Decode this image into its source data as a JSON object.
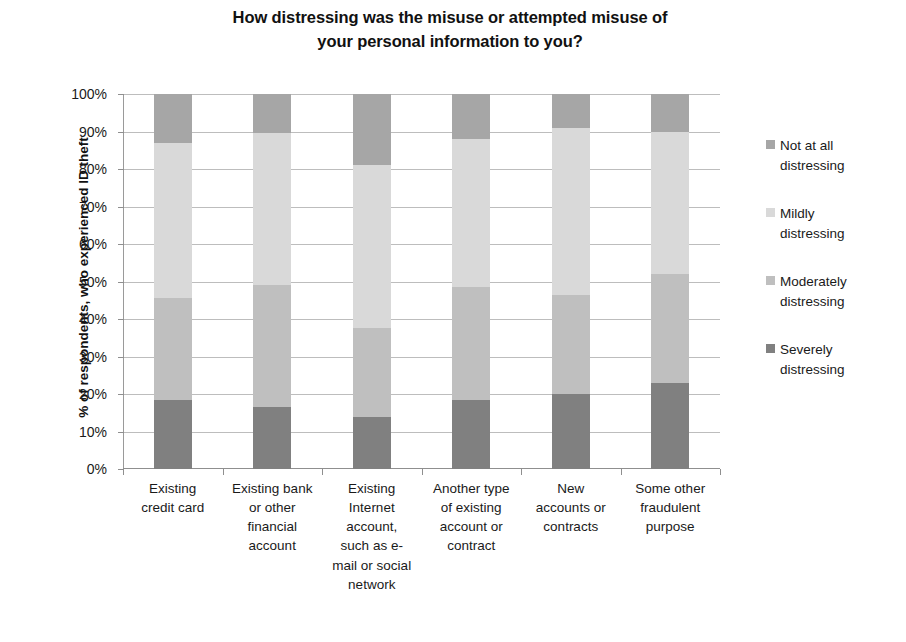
{
  "chart_data": {
    "type": "bar",
    "subtype": "stacked-percent-column",
    "title_lines": [
      "How distressing was the misuse or attempted misuse of",
      "your personal information to you?"
    ],
    "xlabel": "",
    "ylabel": "% of respondents, who experienced ID theft",
    "ylim": [
      0,
      100
    ],
    "ytick_labels": [
      "0%",
      "10%",
      "20%",
      "30%",
      "40%",
      "50%",
      "60%",
      "70%",
      "80%",
      "90%",
      "100%"
    ],
    "ytick_values": [
      0,
      10,
      20,
      30,
      40,
      50,
      60,
      70,
      80,
      90,
      100
    ],
    "grid": true,
    "legend_position": "right",
    "categories": [
      "Existing credit card",
      "Existing bank or other financial account",
      "Existing Internet account, such as e-mail or social network",
      "Another type of existing account or contract",
      "New accounts or contracts",
      "Some other fraudulent purpose"
    ],
    "category_label_lines": [
      [
        "Existing",
        "credit card"
      ],
      [
        "Existing bank",
        "or other",
        "financial",
        "account"
      ],
      [
        "Existing",
        "Internet",
        "account,",
        "such as e-",
        "mail or social",
        "network"
      ],
      [
        "Another type",
        "of existing",
        "account or",
        "contract"
      ],
      [
        "New",
        "accounts or",
        "contracts"
      ],
      [
        "Some other",
        "fraudulent",
        "purpose"
      ]
    ],
    "series": [
      {
        "name": "Severely distressing",
        "color": "#808080",
        "values": [
          18.5,
          16.5,
          14,
          18.5,
          20,
          23
        ]
      },
      {
        "name": "Moderately distressing",
        "color": "#bfbfbf",
        "values": [
          27,
          32.5,
          23.5,
          30,
          26.5,
          29
        ]
      },
      {
        "name": "Mildly distressing",
        "color": "#d9d9d9",
        "values": [
          41.5,
          40.5,
          43.5,
          39.5,
          44.5,
          38
        ]
      },
      {
        "name": "Not at all distressing",
        "color": "#a6a6a6",
        "values": [
          13,
          10.5,
          19,
          12,
          9,
          10
        ]
      }
    ],
    "cumulative_tops": {
      "severely": [
        18.5,
        16.5,
        14.0,
        18.5,
        20.0,
        23.0
      ],
      "moderately": [
        45.5,
        49.0,
        37.5,
        48.5,
        46.5,
        52.0
      ],
      "mildly": [
        87.0,
        89.5,
        81.0,
        88.0,
        91.0,
        90.0
      ],
      "not_at_all": [
        100,
        100,
        100,
        100,
        100,
        100
      ]
    }
  },
  "legend": {
    "items": [
      {
        "label_lines": [
          "Not at all",
          "distressing"
        ],
        "color": "#a6a6a6"
      },
      {
        "label_lines": [
          "Mildly",
          "distressing"
        ],
        "color": "#d9d9d9"
      },
      {
        "label_lines": [
          "Moderately",
          "distressing"
        ],
        "color": "#bfbfbf"
      },
      {
        "label_lines": [
          "Severely",
          "distressing"
        ],
        "color": "#808080"
      }
    ]
  },
  "colors": {
    "background": "#ffffff",
    "text": "#1a1a1a",
    "gridline": "#bdbdbd",
    "axis": "#8f8f8f",
    "not_at_all_distressing": "#a6a6a6",
    "mildly_distressing": "#d9d9d9",
    "moderately_distressing": "#bfbfbf",
    "severely_distressing": "#808080"
  }
}
